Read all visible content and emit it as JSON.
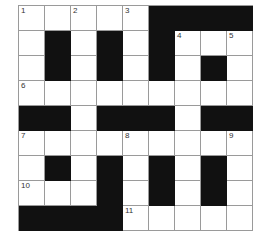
{
  "puzzle": {
    "rows": 9,
    "cols": 9,
    "layout": [
      "WWWWWBBBB",
      "WBWBWBWWW",
      "WBWBWBWBW",
      "WWWWWWWWW",
      "BBWBBBWBB",
      "WWWWWWWWW",
      "WBWBWBWBW",
      "WWWBWBWBW",
      "BBBBWWWWW"
    ],
    "numbers": [
      {
        "r": 0,
        "c": 0,
        "n": "1"
      },
      {
        "r": 0,
        "c": 2,
        "n": "2"
      },
      {
        "r": 0,
        "c": 4,
        "n": "3"
      },
      {
        "r": 1,
        "c": 6,
        "n": "4"
      },
      {
        "r": 1,
        "c": 8,
        "n": "5"
      },
      {
        "r": 3,
        "c": 0,
        "n": "6"
      },
      {
        "r": 5,
        "c": 0,
        "n": "7"
      },
      {
        "r": 5,
        "c": 4,
        "n": "8"
      },
      {
        "r": 5,
        "c": 8,
        "n": "9"
      },
      {
        "r": 7,
        "c": 0,
        "n": "10"
      },
      {
        "r": 8,
        "c": 4,
        "n": "11"
      }
    ],
    "colors": {
      "block": "#111111",
      "cell": "#ffffff",
      "grid_line": "#9a9a9a"
    }
  }
}
